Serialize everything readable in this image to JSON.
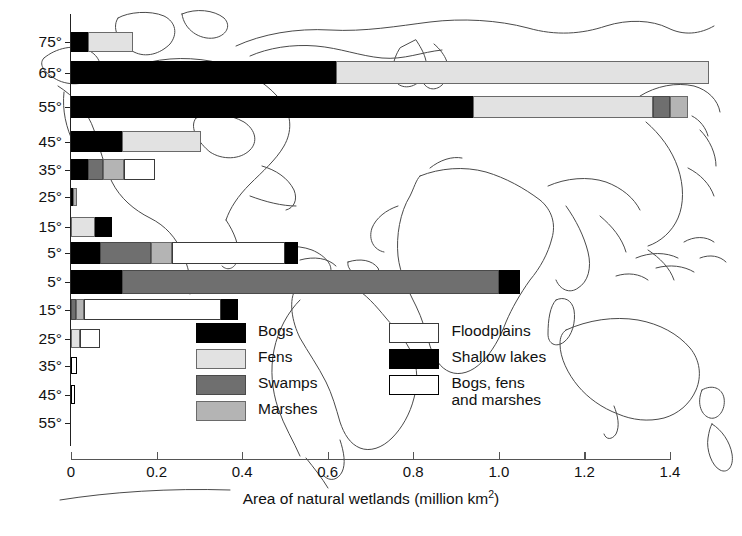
{
  "chart_data": {
    "type": "bar",
    "orientation": "horizontal",
    "stacked": true,
    "title": "",
    "xlabel": "Area of natural wetlands (million km2)",
    "xlabel_base": "Area of natural wetlands (million km",
    "xlabel_sup": "2",
    "xlabel_tail": ")",
    "ylabel": "",
    "xlim": [
      0,
      1.4
    ],
    "xticks": [
      "0",
      "0.2",
      "0.4",
      "0.6",
      "0.8",
      "1.0",
      "1.2",
      "1.4"
    ],
    "xtick_values": [
      0,
      0.2,
      0.4,
      0.6,
      0.8,
      1.0,
      1.2,
      1.4
    ],
    "grid": false,
    "legend_position": "inside-bottom-center",
    "categories": [
      "75°",
      "65°",
      "55°",
      "45°",
      "35°",
      "25°",
      "15°",
      "5°",
      "5°",
      "15°",
      "25°",
      "35°",
      "45°",
      "55°"
    ],
    "series": [
      {
        "name": "Bogs",
        "key": "bogs",
        "color": "#000000",
        "swatch": "sw-bogs",
        "values": [
          0.04,
          0.62,
          0.94,
          0.12,
          0.04,
          0.005,
          0.0,
          0.068,
          0.12,
          0.0,
          0.0,
          0.0,
          0.0,
          0.0
        ]
      },
      {
        "name": "Fens",
        "key": "fens",
        "color": "#e2e2e2",
        "swatch": "sw-fens",
        "values": [
          0.105,
          0.87,
          0.42,
          0.185,
          0.0,
          0.0,
          0.055,
          0.0,
          0.0,
          0.0,
          0.022,
          0.0,
          0.0,
          0.0
        ]
      },
      {
        "name": "Swamps",
        "key": "swamps",
        "color": "#6f6f6f",
        "swatch": "sw-swamps",
        "values": [
          0.0,
          0.0,
          0.04,
          0.0,
          0.035,
          0.0,
          0.0,
          0.118,
          0.88,
          0.012,
          0.0,
          0.0,
          0.0,
          0.0
        ]
      },
      {
        "name": "Marshes",
        "key": "marshes",
        "color": "#b4b4b4",
        "swatch": "sw-marshes",
        "values": [
          0.0,
          0.0,
          0.042,
          0.0,
          0.05,
          0.01,
          0.0,
          0.05,
          0.0,
          0.018,
          0.0,
          0.0,
          0.0,
          0.0
        ]
      },
      {
        "name": "Floodplains",
        "key": "floodplains",
        "color": "#ffffff",
        "swatch": "sw-floodplains",
        "values": [
          0.0,
          0.0,
          0.0,
          0.0,
          0.072,
          0.0,
          0.0,
          0.265,
          0.0,
          0.32,
          0.045,
          0.0,
          0.0,
          0.0
        ]
      },
      {
        "name": "Shallow lakes",
        "key": "shallow_lakes",
        "color": "#000000",
        "swatch": "sw-shallow",
        "values": [
          0.0,
          0.0,
          0.0,
          0.0,
          0.0,
          0.0,
          0.04,
          0.03,
          0.05,
          0.04,
          0.0,
          0.0,
          0.0,
          0.0
        ]
      },
      {
        "name": "Bogs, fens\nand marshes",
        "key": "bogs_fens_marshes",
        "color": "#ffffff",
        "swatch": "sw-bfm",
        "values": [
          0.0,
          0.0,
          0.0,
          0.0,
          0.0,
          0.0,
          0.0,
          0.0,
          0.0,
          0.0,
          0.0,
          0.015,
          0.01,
          0.0
        ]
      }
    ],
    "bars": [
      {
        "label": "75°",
        "y": 32,
        "height": 20,
        "segments": [
          {
            "key": "bogs",
            "value": 0.04
          },
          {
            "key": "fens",
            "value": 0.105
          }
        ]
      },
      {
        "label": "65°",
        "y": 61,
        "height": 23,
        "segments": [
          {
            "key": "bogs",
            "value": 0.62
          },
          {
            "key": "fens",
            "value": 0.87
          }
        ]
      },
      {
        "label": "55°",
        "y": 96,
        "height": 22,
        "segments": [
          {
            "key": "bogs",
            "value": 0.94
          },
          {
            "key": "fens",
            "value": 0.42
          },
          {
            "key": "swamps",
            "value": 0.04
          },
          {
            "key": "marshes",
            "value": 0.042
          }
        ]
      },
      {
        "label": "45°",
        "y": 131,
        "height": 21,
        "segments": [
          {
            "key": "bogs",
            "value": 0.12
          },
          {
            "key": "fens",
            "value": 0.185
          }
        ]
      },
      {
        "label": "35°",
        "y": 159,
        "height": 21,
        "segments": [
          {
            "key": "bogs",
            "value": 0.04
          },
          {
            "key": "swamps",
            "value": 0.035
          },
          {
            "key": "marshes",
            "value": 0.05
          },
          {
            "key": "floodplains",
            "value": 0.072
          }
        ]
      },
      {
        "label": "25°",
        "y": 188,
        "height": 18,
        "segments": [
          {
            "key": "bogs",
            "value": 0.005
          },
          {
            "key": "marshes",
            "value": 0.01
          }
        ]
      },
      {
        "label": "15°",
        "y": 217,
        "height": 20,
        "segments": [
          {
            "key": "fens",
            "value": 0.055
          },
          {
            "key": "shallow_lakes",
            "value": 0.04
          }
        ]
      },
      {
        "label": "5°",
        "y": 242,
        "height": 22,
        "segments": [
          {
            "key": "bogs",
            "value": 0.068
          },
          {
            "key": "swamps",
            "value": 0.118
          },
          {
            "key": "marshes",
            "value": 0.05
          },
          {
            "key": "floodplains",
            "value": 0.265
          },
          {
            "key": "shallow_lakes",
            "value": 0.03
          }
        ]
      },
      {
        "label": "5°",
        "y": 270,
        "height": 24,
        "segments": [
          {
            "key": "bogs",
            "value": 0.12
          },
          {
            "key": "swamps",
            "value": 0.88
          },
          {
            "key": "shallow_lakes",
            "value": 0.05
          }
        ]
      },
      {
        "label": "15°",
        "y": 299,
        "height": 21,
        "segments": [
          {
            "key": "swamps",
            "value": 0.012
          },
          {
            "key": "marshes",
            "value": 0.018
          },
          {
            "key": "floodplains",
            "value": 0.32
          },
          {
            "key": "shallow_lakes",
            "value": 0.04
          }
        ]
      },
      {
        "label": "25°",
        "y": 329,
        "height": 19,
        "segments": [
          {
            "key": "fens",
            "value": 0.022
          },
          {
            "key": "floodplains",
            "value": 0.045
          }
        ]
      },
      {
        "label": "35°",
        "y": 357,
        "height": 17,
        "segments": [
          {
            "key": "bogs_fens_marshes",
            "value": 0.015
          }
        ]
      },
      {
        "label": "45°",
        "y": 385,
        "height": 19,
        "segments": [
          {
            "key": "bogs_fens_marshes",
            "value": 0.01
          }
        ]
      },
      {
        "label": "55°",
        "y": 414,
        "height": 18,
        "segments": []
      }
    ]
  },
  "legend": {
    "columns": [
      {
        "items": [
          {
            "name": "Bogs",
            "swatch": "sw-bogs"
          },
          {
            "name": "Fens",
            "swatch": "sw-fens"
          },
          {
            "name": "Swamps",
            "swatch": "sw-swamps"
          },
          {
            "name": "Marshes",
            "swatch": "sw-marshes"
          }
        ]
      },
      {
        "items": [
          {
            "name": "Floodplains",
            "swatch": "sw-floodplains"
          },
          {
            "name": "Shallow lakes",
            "swatch": "sw-shallow"
          },
          {
            "name": "Bogs, fens\nand marshes",
            "swatch": "sw-bfm"
          }
        ]
      }
    ]
  }
}
